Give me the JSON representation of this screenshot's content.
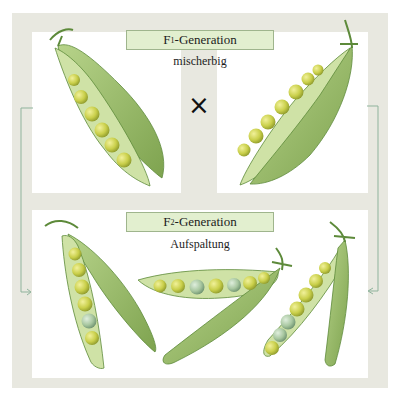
{
  "diagram": {
    "f1": {
      "label_prefix": "F",
      "label_sub": "1",
      "label_suffix": "-Generation",
      "sublabel": "mischerbig",
      "cross_symbol": "×",
      "pods": [
        {
          "name": "f1-pod-left",
          "peas": [
            "yellow",
            "yellow",
            "yellow",
            "yellow",
            "yellow",
            "yellow"
          ]
        },
        {
          "name": "f1-pod-right",
          "peas": [
            "yellow",
            "yellow",
            "yellow",
            "yellow",
            "yellow",
            "yellow",
            "yellow"
          ]
        }
      ]
    },
    "f2": {
      "label_prefix": "F",
      "label_sub": "2",
      "label_suffix": "-Generation",
      "sublabel": "Aufspaltung",
      "pods": [
        {
          "name": "f2-pod-left",
          "peas": [
            "yellow",
            "yellow",
            "yellow",
            "yellow",
            "green",
            "yellow"
          ]
        },
        {
          "name": "f2-pod-middle",
          "peas": [
            "yellow",
            "yellow",
            "green",
            "yellow",
            "green",
            "yellow",
            "yellow"
          ]
        },
        {
          "name": "f2-pod-right",
          "peas": [
            "yellow",
            "green",
            "green",
            "yellow",
            "yellow",
            "yellow",
            "yellow"
          ]
        }
      ]
    },
    "colors": {
      "frame": "#e8e8e0",
      "panel": "#ffffff",
      "label_fill": "#e2efcf",
      "label_border": "#9fb58d",
      "arrow": "#8fb39c",
      "pod": "#9cbf6a",
      "pod_dark": "#6f9a45",
      "pea_yellow": "#c9cf4a",
      "pea_green": "#a8c7a0"
    }
  }
}
